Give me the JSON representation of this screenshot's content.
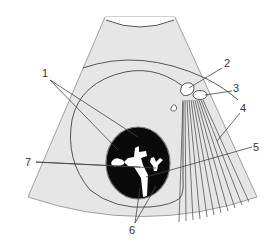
{
  "figure": {
    "type": "ultrasound-sector-schematic",
    "colors": {
      "background": "#ffffff",
      "sector_fill": "#e6e6e6",
      "outline": "#555555",
      "lesion_fill": "#0a0a0a",
      "echo_fill": "#ffffff",
      "leader_line": "#444444"
    },
    "labels": [
      {
        "id": "1",
        "text": "1"
      },
      {
        "id": "2",
        "text": "2"
      },
      {
        "id": "3",
        "text": "3"
      },
      {
        "id": "4",
        "text": "4"
      },
      {
        "id": "5",
        "text": "5"
      },
      {
        "id": "6",
        "text": "6"
      },
      {
        "id": "7",
        "text": "7"
      }
    ]
  }
}
